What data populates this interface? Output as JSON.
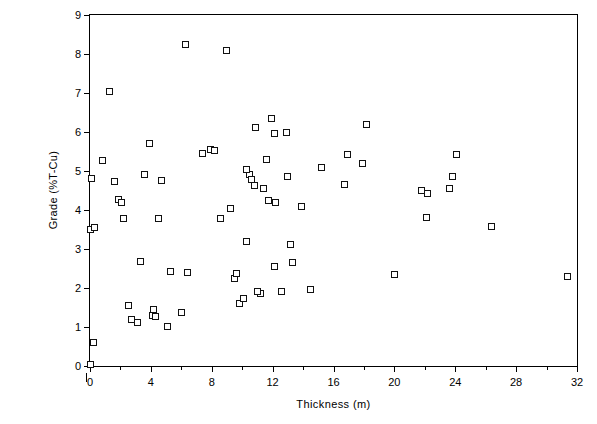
{
  "chart_data": {
    "type": "scatter",
    "title": "",
    "xlabel": "Thickness (m)",
    "ylabel": "Grade (%T-Cu)",
    "xlim": [
      0,
      32
    ],
    "ylim": [
      0,
      9
    ],
    "xticks": [
      0,
      4,
      8,
      12,
      16,
      20,
      24,
      28,
      32
    ],
    "xticks_minor": [
      2,
      6,
      10,
      14,
      18,
      22,
      26,
      30
    ],
    "yticks": [
      0,
      1,
      2,
      3,
      4,
      5,
      6,
      7,
      8,
      9
    ],
    "xtick_labels": [
      "0",
      "4",
      "8",
      "12",
      "16",
      "20",
      "24",
      "28",
      "32"
    ],
    "ytick_labels": [
      "0",
      "1",
      "2",
      "3",
      "4",
      "5",
      "6",
      "7",
      "8",
      "9"
    ],
    "grid": false,
    "legend": null,
    "marker": {
      "shape": "open-square",
      "edge_color": "#111111",
      "face_color": "#ffffff",
      "size_px": 7
    },
    "points": [
      {
        "x": 0.0,
        "y": 0.05
      },
      {
        "x": 0.2,
        "y": 0.6
      },
      {
        "x": 0.0,
        "y": 3.5
      },
      {
        "x": 0.3,
        "y": 3.55
      },
      {
        "x": 0.1,
        "y": 4.82
      },
      {
        "x": 0.8,
        "y": 5.27
      },
      {
        "x": 1.25,
        "y": 7.05
      },
      {
        "x": 1.6,
        "y": 4.72
      },
      {
        "x": 1.9,
        "y": 4.27
      },
      {
        "x": 2.1,
        "y": 4.2
      },
      {
        "x": 2.2,
        "y": 3.78
      },
      {
        "x": 2.7,
        "y": 1.2
      },
      {
        "x": 2.5,
        "y": 1.55
      },
      {
        "x": 3.1,
        "y": 1.12
      },
      {
        "x": 3.3,
        "y": 2.68
      },
      {
        "x": 3.6,
        "y": 4.9
      },
      {
        "x": 3.9,
        "y": 5.7
      },
      {
        "x": 4.1,
        "y": 1.3
      },
      {
        "x": 4.3,
        "y": 1.28
      },
      {
        "x": 4.2,
        "y": 1.45
      },
      {
        "x": 4.5,
        "y": 3.78
      },
      {
        "x": 4.7,
        "y": 4.75
      },
      {
        "x": 5.1,
        "y": 1.02
      },
      {
        "x": 5.3,
        "y": 2.42
      },
      {
        "x": 6.0,
        "y": 1.38
      },
      {
        "x": 6.3,
        "y": 8.25
      },
      {
        "x": 6.4,
        "y": 2.4
      },
      {
        "x": 7.4,
        "y": 5.45
      },
      {
        "x": 7.9,
        "y": 5.55
      },
      {
        "x": 8.2,
        "y": 5.52
      },
      {
        "x": 8.6,
        "y": 3.78
      },
      {
        "x": 8.95,
        "y": 8.1
      },
      {
        "x": 9.2,
        "y": 4.05
      },
      {
        "x": 9.5,
        "y": 2.25
      },
      {
        "x": 9.6,
        "y": 2.38
      },
      {
        "x": 9.8,
        "y": 1.6
      },
      {
        "x": 10.1,
        "y": 1.72
      },
      {
        "x": 10.3,
        "y": 3.2
      },
      {
        "x": 10.5,
        "y": 4.9
      },
      {
        "x": 10.3,
        "y": 5.05
      },
      {
        "x": 10.6,
        "y": 4.78
      },
      {
        "x": 10.9,
        "y": 6.12
      },
      {
        "x": 10.8,
        "y": 4.62
      },
      {
        "x": 11.2,
        "y": 1.85
      },
      {
        "x": 11.0,
        "y": 1.9
      },
      {
        "x": 11.4,
        "y": 4.55
      },
      {
        "x": 11.6,
        "y": 5.3
      },
      {
        "x": 11.7,
        "y": 4.25
      },
      {
        "x": 11.9,
        "y": 6.35
      },
      {
        "x": 12.1,
        "y": 5.95
      },
      {
        "x": 12.2,
        "y": 4.18
      },
      {
        "x": 12.1,
        "y": 2.55
      },
      {
        "x": 12.6,
        "y": 1.92
      },
      {
        "x": 12.9,
        "y": 6.0
      },
      {
        "x": 13.0,
        "y": 4.85
      },
      {
        "x": 13.2,
        "y": 3.12
      },
      {
        "x": 13.3,
        "y": 2.65
      },
      {
        "x": 13.9,
        "y": 4.08
      },
      {
        "x": 14.5,
        "y": 1.95
      },
      {
        "x": 15.2,
        "y": 5.08
      },
      {
        "x": 16.7,
        "y": 4.65
      },
      {
        "x": 16.9,
        "y": 5.42
      },
      {
        "x": 17.9,
        "y": 5.2
      },
      {
        "x": 18.2,
        "y": 6.2
      },
      {
        "x": 20.0,
        "y": 2.35
      },
      {
        "x": 21.8,
        "y": 4.5
      },
      {
        "x": 22.1,
        "y": 3.82
      },
      {
        "x": 22.2,
        "y": 4.42
      },
      {
        "x": 23.6,
        "y": 4.55
      },
      {
        "x": 23.8,
        "y": 4.85
      },
      {
        "x": 24.1,
        "y": 5.42
      },
      {
        "x": 26.4,
        "y": 3.58
      },
      {
        "x": 31.4,
        "y": 2.3
      }
    ]
  }
}
